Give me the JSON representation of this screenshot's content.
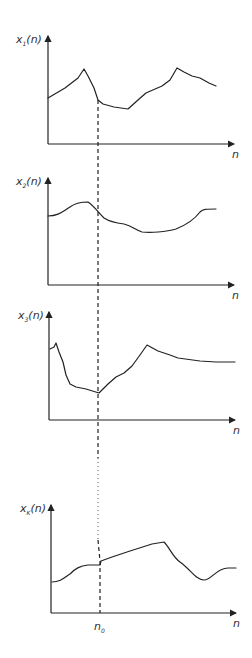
{
  "diagram": {
    "panels": [
      {
        "ylabel_main": "x",
        "ylabel_sub": "1",
        "ylabel_arg": "(n)",
        "xlabel": "n"
      },
      {
        "ylabel_main": "x",
        "ylabel_sub": "2",
        "ylabel_arg": "(n)",
        "xlabel": "n"
      },
      {
        "ylabel_main": "x",
        "ylabel_sub": "3",
        "ylabel_arg": "(n)",
        "xlabel": "n"
      },
      {
        "ylabel_main": "x",
        "ylabel_sub": "K",
        "ylabel_arg": "(n)",
        "xlabel": "n"
      }
    ],
    "marker": {
      "main": "n",
      "sub": "0"
    }
  }
}
